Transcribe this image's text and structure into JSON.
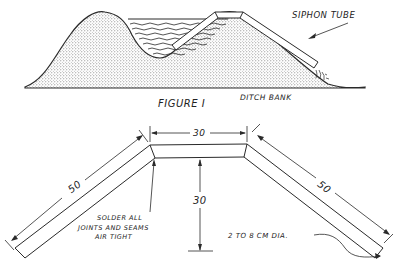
{
  "figure1": {
    "caption": "FIGURE I",
    "labels": {
      "siphon_tube": "SIPHON TUBE",
      "ditch_bank": "DITCH BANK"
    }
  },
  "figure2": {
    "dimensions": {
      "top_width": "30",
      "left_arm_length": "50",
      "right_arm_length": "50",
      "height": "30"
    },
    "notes": {
      "solder_line1": "SOLDER ALL",
      "solder_line2": "JOINTS AND SEAMS",
      "solder_line3": "AIR TIGHT",
      "diameter": "2 TO 8 CM DIA."
    }
  },
  "colors": {
    "ink": "#2a2a2a",
    "stipple": "#9a9a9a",
    "background": "#ffffff"
  }
}
